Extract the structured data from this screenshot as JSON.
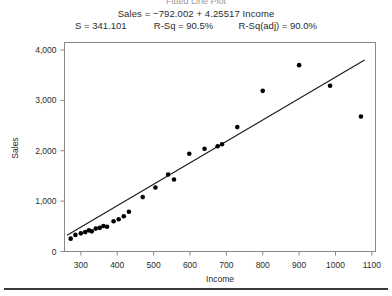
{
  "figure": {
    "title_cut": "Fitted Line Plot",
    "equation": "Sales = −792.002 + 4.25517 Income",
    "stats": {
      "s_label": "S = 341.101",
      "rsq_label": "R-Sq = 90.5%",
      "rsqadj_label": "R-Sq(adj) = 90.0%"
    }
  },
  "chart_data": {
    "type": "scatter",
    "title": "Fitted Line Plot",
    "subtitle": "Sales = −792.002 + 4.25517 Income",
    "xlabel": "Income",
    "ylabel": "Sales",
    "xlim": [
      255,
      1110
    ],
    "ylim": [
      0,
      4150
    ],
    "xticks": [
      300,
      400,
      500,
      600,
      700,
      800,
      900,
      1000,
      1100
    ],
    "xticklabels": [
      "300",
      "400",
      "500",
      "600",
      "700",
      "800",
      "900",
      "1000",
      "1100"
    ],
    "yticks": [
      0,
      1000,
      2000,
      3000,
      4000
    ],
    "yticklabels": [
      "0",
      "1,000",
      "2,000",
      "3,000",
      "4,000"
    ],
    "grid": false,
    "legend": false,
    "x": [
      272,
      285,
      300,
      312,
      322,
      330,
      341,
      352,
      362,
      372,
      390,
      404,
      418,
      432,
      470,
      505,
      540,
      556,
      598,
      640,
      676,
      688,
      730,
      800,
      900,
      985,
      1070
    ],
    "y": [
      255,
      330,
      360,
      385,
      420,
      400,
      455,
      470,
      505,
      490,
      600,
      640,
      700,
      790,
      1080,
      1270,
      1530,
      1430,
      1940,
      2040,
      2090,
      2130,
      2470,
      3190,
      3700,
      3290,
      2680
    ],
    "regression": {
      "intercept": -792.002,
      "slope": 4.25517,
      "x_start": 262,
      "x_end": 1080,
      "s": 341.101,
      "r_sq": 90.5,
      "r_sq_adj": 90.0
    }
  }
}
